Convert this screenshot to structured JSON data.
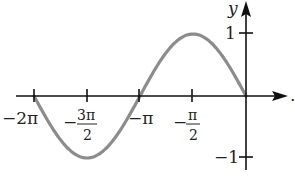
{
  "chart_data": {
    "type": "line",
    "title": "",
    "function": "y = -sin(x)",
    "xlabel": "x",
    "ylabel": "y",
    "xlim": [
      -6.2832,
      0.5
    ],
    "ylim": [
      -1.2,
      1.3
    ],
    "grid": false,
    "legend": null,
    "x_ticks": [
      {
        "value": -6.2832,
        "label": "-2π"
      },
      {
        "value": -4.7124,
        "label": "-3π/2",
        "num": "3π",
        "den": "2"
      },
      {
        "value": -3.1416,
        "label": "-π"
      },
      {
        "value": -1.5708,
        "label": "-π/2",
        "num": "π",
        "den": "2"
      }
    ],
    "y_ticks": [
      {
        "value": 1,
        "label": "1"
      },
      {
        "value": -1,
        "label": "-1"
      }
    ],
    "series": [
      {
        "name": "-sin(x)",
        "color": "#8c8c8c",
        "x": [
          -6.2832,
          -5.4978,
          -4.7124,
          -3.927,
          -3.1416,
          -2.3562,
          -1.5708,
          -0.7854,
          0
        ],
        "y": [
          0,
          -0.7071,
          -1,
          -0.7071,
          0,
          0.7071,
          1,
          0.7071,
          0
        ]
      }
    ]
  },
  "labels": {
    "y_axis": "y",
    "x_axis": ".",
    "tick_y1": "1",
    "tick_ym1": "−1",
    "tick_2pi": "−2π",
    "tick_pi": "−π",
    "minus": "−",
    "three_pi": "3π",
    "pi": "π",
    "two": "2"
  },
  "colors": {
    "axis": "#111111",
    "curve": "#8c8c8c"
  }
}
